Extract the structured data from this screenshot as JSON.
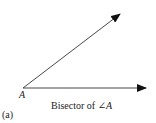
{
  "diagram": {
    "vertex_label": "A",
    "caption_prefix": "Bisector of ",
    "angle_symbol": "∠",
    "caption_var": "A",
    "subfigure_label": "(a)",
    "line_color": "#333333",
    "rays": [
      {
        "name": "upper-ray",
        "from": [
          23,
          88
        ],
        "to": [
          120,
          14
        ]
      },
      {
        "name": "lower-ray",
        "from": [
          23,
          88
        ],
        "to": [
          146,
          88
        ]
      }
    ]
  }
}
